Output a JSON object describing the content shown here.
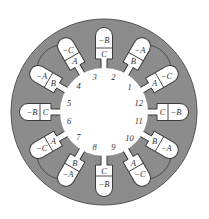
{
  "colors": {
    "stator": "#8c8c8c",
    "stator_edge": "#555555",
    "bore": "#ffffff",
    "slot_fill": "#ffffff",
    "slot_edge": "#3a3a3a",
    "text": "#333333",
    "end_connection": "#4a4a4a"
  },
  "slots": [
    {
      "number": "1",
      "inner": "A",
      "outer": "−C"
    },
    {
      "number": "2",
      "inner": "B",
      "outer": "−A"
    },
    {
      "number": "3",
      "inner": "C",
      "outer": "−B"
    },
    {
      "number": "4",
      "inner": "A",
      "outer": "−C"
    },
    {
      "number": "5",
      "inner": "B",
      "outer": "−A"
    },
    {
      "number": "6",
      "inner": "C",
      "outer": "−B"
    },
    {
      "number": "7",
      "inner": "A",
      "outer": "−C"
    },
    {
      "number": "8",
      "inner": "B",
      "outer": "−A"
    },
    {
      "number": "9",
      "inner": "C",
      "outer": "−B"
    },
    {
      "number": "10",
      "inner": "A",
      "outer": "−C"
    },
    {
      "number": "11",
      "inner": "B",
      "outer": "−A"
    },
    {
      "number": "12",
      "inner": "C",
      "outer": "−B"
    }
  ],
  "end_connections": [
    {
      "from_slot": "1",
      "to_slot": "2"
    },
    {
      "from_slot": "4",
      "to_slot": "5"
    },
    {
      "from_slot": "7",
      "to_slot": "8"
    },
    {
      "from_slot": "10",
      "to_slot": "11"
    }
  ]
}
